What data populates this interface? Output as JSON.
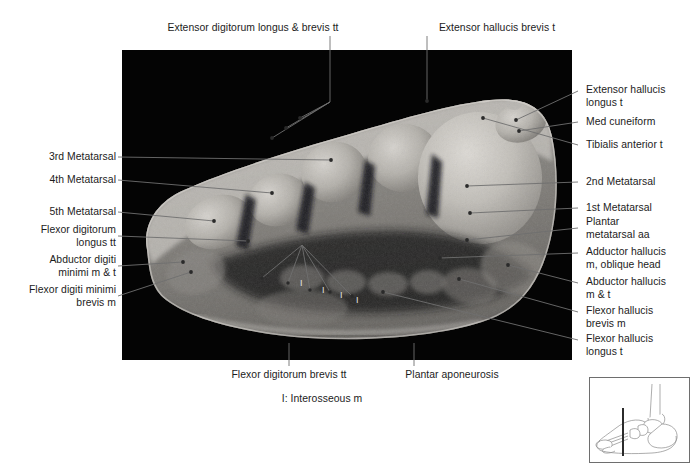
{
  "figure": {
    "plate": {
      "background_color": "#040404",
      "specimen_description": "Transverse section of foot through metatarsals",
      "x": 122,
      "y": 50,
      "width": 450,
      "height": 310
    },
    "labels_top": [
      {
        "text": "Extensor digitorum longus & brevis tt",
        "x": 253,
        "y": 28,
        "align": "center",
        "leader": [
          [
            330,
            36
          ],
          [
            330,
            102
          ]
        ]
      },
      {
        "text": "Extensor hallucis brevis t",
        "x": 497,
        "y": 28,
        "align": "center",
        "leader": [
          [
            427,
            36
          ],
          [
            427,
            101
          ]
        ]
      }
    ],
    "labels_left": [
      {
        "text": "3rd Metatarsal",
        "x": 118,
        "y": 152,
        "lines": 1,
        "leader": [
          [
            122,
            157
          ],
          [
            331,
            160
          ]
        ]
      },
      {
        "text": "4th Metatarsal",
        "x": 118,
        "y": 175,
        "lines": 1,
        "leader": [
          [
            122,
            180
          ],
          [
            272,
            193
          ]
        ]
      },
      {
        "text": "5th Metatarsal",
        "x": 118,
        "y": 207,
        "lines": 1,
        "leader": [
          [
            122,
            212
          ],
          [
            214,
            221
          ]
        ]
      },
      {
        "text": "Flexor digitorum\nlongus tt",
        "x": 118,
        "y": 224,
        "lines": 2,
        "leader": [
          [
            122,
            236
          ],
          [
            248,
            241
          ]
        ]
      },
      {
        "text": "Abductor digiti\nminimi m & t",
        "x": 118,
        "y": 254,
        "lines": 2,
        "leader": [
          [
            122,
            266
          ],
          [
            183,
            262
          ]
        ]
      },
      {
        "text": "Flexor digiti minimi\nbrevis m",
        "x": 118,
        "y": 284,
        "lines": 2,
        "leader": [
          [
            122,
            296
          ],
          [
            191,
            272
          ]
        ]
      }
    ],
    "labels_right": [
      {
        "text": "Extensor hallucis\nlongus t",
        "x": 586,
        "y": 84,
        "lines": 2,
        "leader": [
          [
            572,
            91
          ],
          [
            516,
            120
          ]
        ]
      },
      {
        "text": "Med cuneiform",
        "x": 586,
        "y": 117,
        "lines": 1,
        "leader": [
          [
            572,
            122
          ],
          [
            519,
            131
          ]
        ]
      },
      {
        "text": "Tibialis anterior t",
        "x": 586,
        "y": 140,
        "lines": 1,
        "leader": [
          [
            572,
            145
          ],
          [
            483,
            118
          ]
        ]
      },
      {
        "text": "2nd Metatarsal",
        "x": 586,
        "y": 177,
        "lines": 1,
        "leader": [
          [
            572,
            182
          ],
          [
            467,
            186
          ]
        ]
      },
      {
        "text": "1st Metatarsal",
        "x": 586,
        "y": 203,
        "lines": 1,
        "leader": [
          [
            572,
            208
          ],
          [
            470,
            213
          ]
        ]
      },
      {
        "text": "Plantar\nmetatarsal aa",
        "x": 586,
        "y": 216,
        "lines": 2,
        "leader": [
          [
            572,
            228
          ],
          [
            467,
            240
          ]
        ]
      },
      {
        "text": "Adductor hallucis\nm, oblique head",
        "x": 586,
        "y": 246,
        "lines": 2,
        "leader": [
          [
            572,
            253
          ],
          [
            440,
            258
          ]
        ]
      },
      {
        "text": "Abductor hallucis\nm & t",
        "x": 586,
        "y": 276,
        "lines": 2,
        "leader": [
          [
            572,
            283
          ],
          [
            508,
            265
          ]
        ]
      },
      {
        "text": "Flexor hallucis\nbrevis m",
        "x": 586,
        "y": 305,
        "lines": 2,
        "leader": [
          [
            572,
            312
          ],
          [
            459,
            279
          ]
        ]
      },
      {
        "text": "Flexor hallucis\nlongus t",
        "x": 586,
        "y": 333,
        "lines": 2,
        "leader": [
          [
            572,
            340
          ],
          [
            383,
            292
          ]
        ]
      }
    ],
    "labels_bottom": [
      {
        "text": "Flexor digitorum brevis tt",
        "x": 289,
        "y": 371,
        "align": "center",
        "leader": [
          [
            289,
            369
          ],
          [
            289,
            345
          ]
        ]
      },
      {
        "text": "Plantar aponeurosis",
        "x": 452,
        "y": 371,
        "align": "center",
        "leader": [
          [
            414,
            369
          ],
          [
            414,
            345
          ]
        ]
      }
    ],
    "caption": {
      "text": "I: Interosseous m",
      "x": 322,
      "y": 397
    },
    "inset": {
      "name": "foot-orientation-inset",
      "description": "Lateral view of foot skeleton with vertical section plane line",
      "x": 589,
      "y": 377,
      "width": 101,
      "height": 86,
      "border_color": "#6e6e6e",
      "section_line_color": "#2b2b2b"
    },
    "interosseous_markers": [
      {
        "label": "I",
        "x": 300,
        "y": 283
      },
      {
        "label": "I",
        "x": 322,
        "y": 290
      },
      {
        "label": "I",
        "x": 340,
        "y": 295
      },
      {
        "label": "I",
        "x": 356,
        "y": 300
      }
    ],
    "colors": {
      "plate_background": "#040404",
      "leader_line": "#6a6a6a",
      "text": "#1c1c1c",
      "page_background": "#ffffff"
    }
  }
}
